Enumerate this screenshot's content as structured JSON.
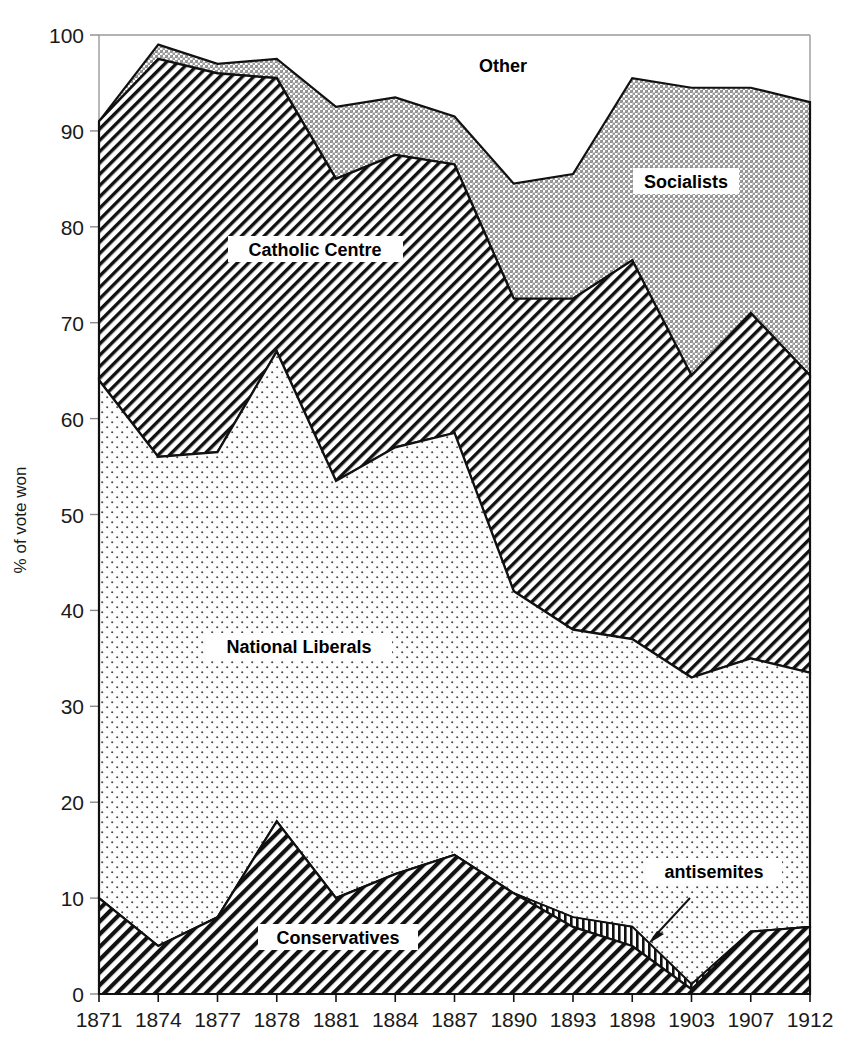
{
  "chart_data": {
    "type": "area",
    "stacked": true,
    "title": "",
    "xlabel": "",
    "ylabel": "% of vote won",
    "ylim": [
      0,
      100
    ],
    "yticks": [
      0,
      10,
      20,
      30,
      40,
      50,
      60,
      70,
      80,
      90,
      100
    ],
    "grid": false,
    "legend": "inline-labels",
    "categories": [
      "1871",
      "1874",
      "1877",
      "1878",
      "1881",
      "1884",
      "1887",
      "1890",
      "1893",
      "1898",
      "1903",
      "1907",
      "1912"
    ],
    "series": [
      {
        "name": "Conservatives",
        "label": "Conservatives",
        "pattern": "diagonal-hatch-right",
        "values": [
          10.0,
          5.0,
          8.0,
          18.0,
          10.0,
          12.5,
          14.5,
          10.5,
          7.0,
          5.0,
          0.5,
          6.5,
          7.0
        ]
      },
      {
        "name": "antisemites",
        "label": "antisemites",
        "pattern": "vertical-stripe",
        "values": [
          0,
          0,
          0,
          0,
          0,
          0,
          0,
          0,
          1.0,
          2.0,
          0.5,
          0,
          0
        ]
      },
      {
        "name": "National Liberals",
        "label": "National Liberals",
        "pattern": "fine-dots-light",
        "values": [
          54.0,
          51.0,
          48.5,
          49.0,
          43.5,
          44.5,
          44.0,
          31.5,
          30.0,
          30.0,
          32.0,
          28.5,
          26.5
        ]
      },
      {
        "name": "Catholic Centre",
        "label": "Catholic Centre",
        "pattern": "diagonal-hatch-right-dense",
        "values": [
          27.0,
          41.5,
          39.5,
          28.5,
          31.5,
          30.5,
          28.0,
          30.5,
          34.5,
          39.5,
          31.5,
          36.0,
          31.0
        ]
      },
      {
        "name": "Socialists",
        "label": "Socialists",
        "pattern": "checker-medium",
        "values": [
          0.0,
          0.5,
          1.0,
          7.5,
          6.0,
          6.0,
          5.0,
          12.0,
          13.0,
          19.0,
          22.5,
          23.5,
          28.5
        ]
      },
      {
        "name": "Other",
        "label": "Other",
        "pattern": "none-white",
        "values": [
          9.0,
          1.0,
          3.0,
          2.5,
          7.5,
          6.5,
          8.5,
          15.5,
          14.5,
          4.5,
          13.0,
          5.5,
          7.0
        ]
      }
    ],
    "cumulative_tops": {
      "conservatives": [
        10.0,
        5.0,
        8.0,
        18.0,
        10.0,
        12.5,
        14.5,
        10.5,
        7.0,
        5.0,
        0.5,
        6.5,
        7.0
      ],
      "antisemites": [
        10.0,
        5.0,
        8.0,
        18.0,
        10.0,
        12.5,
        14.5,
        10.5,
        8.0,
        7.0,
        1.0,
        6.5,
        7.0
      ],
      "national_liberals": [
        64.0,
        56.0,
        56.5,
        67.0,
        53.5,
        57.0,
        58.5,
        42.0,
        38.0,
        37.0,
        33.0,
        35.0,
        33.5
      ],
      "catholic_centre": [
        91.0,
        97.5,
        96.0,
        95.5,
        85.0,
        87.5,
        86.5,
        72.5,
        72.5,
        76.5,
        64.5,
        71.0,
        64.5
      ],
      "socialists": [
        91.0,
        99.0,
        97.0,
        97.5,
        92.5,
        93.5,
        91.5,
        84.5,
        85.5,
        95.5,
        94.5,
        94.5,
        93.0
      ]
    },
    "annotations": [
      {
        "name": "antisemites-callout",
        "text": "antisemites",
        "target_year": "1898",
        "arrow": true
      }
    ]
  },
  "labels": {
    "other": "Other",
    "socialists": "Socialists",
    "catholic_centre": "Catholic Centre",
    "national_liberals": "National Liberals",
    "conservatives": "Conservatives",
    "antisemites": "antisemites"
  },
  "axis": {
    "y_title": "% of vote won",
    "y_ticks": [
      "0",
      "10",
      "20",
      "30",
      "40",
      "50",
      "60",
      "70",
      "80",
      "90",
      "100"
    ],
    "x_ticks": [
      "1871",
      "1874",
      "1877",
      "1878",
      "1881",
      "1884",
      "1887",
      "1890",
      "1893",
      "1898",
      "1903",
      "1907",
      "1912"
    ]
  },
  "colors": {
    "ink": "#000000",
    "axis": "#8a8a8a",
    "background": "#ffffff",
    "socialists_fill": "#c9c9c9",
    "national_liberals_fill": "#f7f7f7"
  }
}
